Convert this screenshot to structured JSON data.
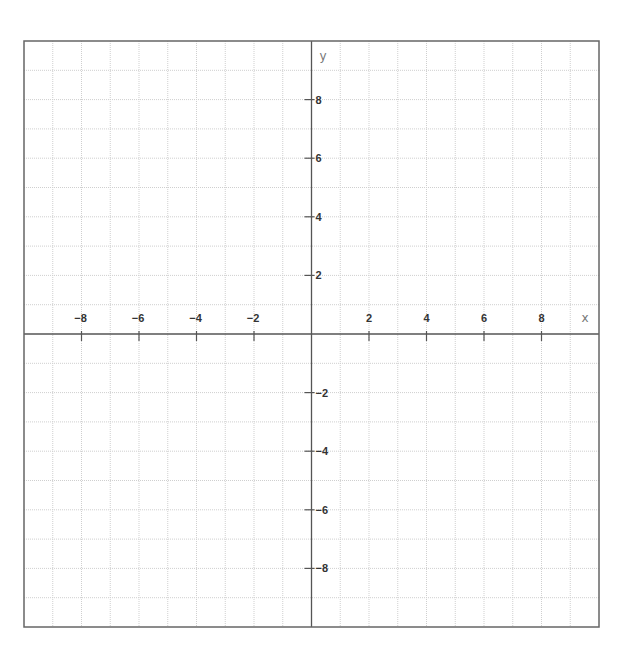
{
  "chart_data": {
    "type": "line",
    "title": "",
    "xlabel": "x",
    "ylabel": "y",
    "xlim": [
      -10,
      10
    ],
    "ylim": [
      -10,
      10
    ],
    "grid": true,
    "grid_step": 1,
    "x_ticks": [
      -8,
      -6,
      -4,
      -2,
      2,
      4,
      6,
      8
    ],
    "x_tick_labels": [
      "−8",
      "−6",
      "−4",
      "−2",
      "2",
      "4",
      "6",
      "8"
    ],
    "y_ticks": [
      8,
      6,
      4,
      2,
      -2,
      -4,
      -6,
      -8
    ],
    "y_tick_labels": [
      "8",
      "6",
      "4",
      "2",
      "−2",
      "−4",
      "−6",
      "−8"
    ],
    "series": [],
    "legend": null
  },
  "colors": {
    "frame": "#666666",
    "axis": "#555555",
    "grid": "#cfcfcf",
    "label": "#333333",
    "axis_name": "#777777"
  }
}
